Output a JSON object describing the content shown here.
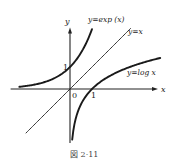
{
  "chart_data": {
    "type": "line",
    "title": "",
    "caption": "図 2·11",
    "xlabel": "x",
    "ylabel": "y",
    "xlim": [
      -2.7,
      4.0
    ],
    "ylim": [
      -2.45,
      2.8
    ],
    "grid": false,
    "origin_label": "0",
    "x_tick_labels": [
      {
        "value": 1,
        "label": "1"
      }
    ],
    "y_tick_labels": [
      {
        "value": 1,
        "label": "1"
      }
    ],
    "series": [
      {
        "name": "y=exp (x)",
        "function": "exp",
        "x_range": [
          -2.3,
          1.0
        ]
      },
      {
        "name": "y=x",
        "function": "identity",
        "x_range": [
          -2.0,
          2.75
        ]
      },
      {
        "name": "y=log x",
        "function": "log",
        "x_range": [
          0.1,
          4.1
        ]
      }
    ],
    "annotations": [
      {
        "text": "y=exp (x)",
        "series": "exp"
      },
      {
        "text": "y=x",
        "series": "identity"
      },
      {
        "text": "y=log x",
        "series": "log"
      }
    ]
  }
}
